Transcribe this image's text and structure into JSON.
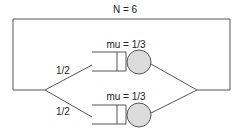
{
  "diagram": {
    "type": "closed queueing network",
    "population_label": "N = 6",
    "routing": [
      {
        "label": "1/2",
        "to": "upper-server"
      },
      {
        "label": "1/2",
        "to": "lower-server"
      }
    ],
    "servers": [
      {
        "name": "upper-server",
        "rate_label": "mu = 1/3"
      },
      {
        "name": "lower-server",
        "rate_label": "mu = 1/3"
      }
    ],
    "colors": {
      "line": "#555555",
      "server_fill": "#dcdcdc"
    }
  }
}
